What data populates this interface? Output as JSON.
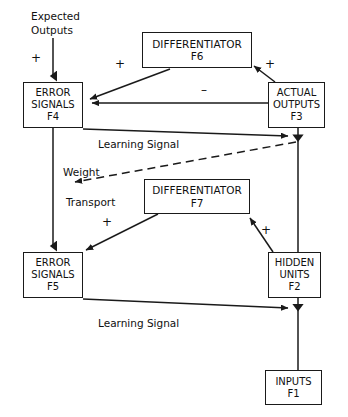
{
  "diagram": {
    "background_color": "#ffffff",
    "line_color": "#1a1a1a",
    "text_color": "#101010",
    "nodes": [
      {
        "id": "F6",
        "name": "differentiator-f6",
        "line1": "DIFFERENTIATOR",
        "line2": "F6",
        "x": 142,
        "y": 32,
        "w": 110,
        "h": 36,
        "font_size": 10.5
      },
      {
        "id": "F3",
        "name": "actual-outputs-f3",
        "line1": "ACTUAL",
        "line2": "OUTPUTS",
        "line3": "F3",
        "x": 268,
        "y": 82,
        "w": 57,
        "h": 46,
        "font_size": 10
      },
      {
        "id": "F4",
        "name": "error-signals-f4",
        "line1": "ERROR",
        "line2": "SIGNALS",
        "line3": "F4",
        "x": 23,
        "y": 82,
        "w": 60,
        "h": 46,
        "font_size": 10
      },
      {
        "id": "F7",
        "name": "differentiator-f7",
        "line1": "DIFFERENTIATOR",
        "line2": "F7",
        "x": 144,
        "y": 179,
        "w": 106,
        "h": 35,
        "font_size": 10.5
      },
      {
        "id": "F5",
        "name": "error-signals-f5",
        "line1": "ERROR",
        "line2": "SIGNALS",
        "line3": "F5",
        "x": 23,
        "y": 252,
        "w": 60,
        "h": 46,
        "font_size": 10
      },
      {
        "id": "F2",
        "name": "hidden-units-f2",
        "line1": "HIDDEN",
        "line2": "UNITS",
        "line3": "F2",
        "x": 268,
        "y": 252,
        "w": 53,
        "h": 46,
        "font_size": 10
      },
      {
        "id": "F1",
        "name": "inputs-f1",
        "line1": "INPUTS",
        "line2": "F1",
        "x": 265,
        "y": 370,
        "w": 57,
        "h": 35,
        "font_size": 10
      }
    ],
    "labels": [
      {
        "id": "expected-outputs",
        "name": "expected-outputs-label",
        "text": "Expected",
        "x": 31,
        "y": 10,
        "font_size": 10.5
      },
      {
        "id": "expected-outputs-2",
        "name": "expected-outputs-label-line2",
        "text": "Outputs",
        "x": 31,
        "y": 24,
        "font_size": 10.5
      },
      {
        "id": "learning-signal-top",
        "name": "learning-signal-label-top",
        "text": "Learning Signal",
        "x": 98,
        "y": 138,
        "font_size": 10.5
      },
      {
        "id": "weight",
        "name": "weight-label",
        "text": "Weight",
        "x": 63,
        "y": 166,
        "font_size": 10.5
      },
      {
        "id": "transport",
        "name": "transport-label",
        "text": "Transport",
        "x": 66,
        "y": 196,
        "font_size": 10.5
      },
      {
        "id": "learning-signal-bottom",
        "name": "learning-signal-label-bottom",
        "text": "Learning Signal",
        "x": 98,
        "y": 317,
        "font_size": 10.5
      }
    ],
    "signs": [
      {
        "id": "plus-expected",
        "name": "plus-sign-expected-outputs",
        "text": "+",
        "x": 31,
        "y": 52,
        "font_size": 12
      },
      {
        "id": "plus-f6-out",
        "name": "plus-sign-f6-output",
        "text": "+",
        "x": 115,
        "y": 58,
        "font_size": 12
      },
      {
        "id": "plus-f3-up",
        "name": "plus-sign-f3-to-f6",
        "text": "+",
        "x": 265,
        "y": 58,
        "font_size": 12
      },
      {
        "id": "minus-f3-f4",
        "name": "minus-sign-f3-to-f4",
        "text": "–",
        "x": 201,
        "y": 84,
        "font_size": 12
      },
      {
        "id": "plus-f7-left",
        "name": "plus-sign-f7-to-f5",
        "text": "+",
        "x": 102,
        "y": 216,
        "font_size": 12
      },
      {
        "id": "plus-f7-right",
        "name": "plus-sign-f2-to-f7",
        "text": "+",
        "x": 261,
        "y": 224,
        "font_size": 12
      }
    ],
    "edges": [
      {
        "id": "expected-to-f4",
        "name": "edge-expected-outputs-to-f4",
        "style": "solid",
        "arrow": "filled-triangle"
      },
      {
        "id": "f6-to-f4",
        "name": "edge-f6-to-f4",
        "style": "solid",
        "arrow": "filled-triangle"
      },
      {
        "id": "f3-to-f6",
        "name": "edge-f3-to-f6",
        "style": "solid",
        "arrow": "filled-triangle"
      },
      {
        "id": "f3-to-f4",
        "name": "edge-f3-to-f4",
        "style": "solid",
        "arrow": "filled-triangle"
      },
      {
        "id": "f4-to-f3-learning",
        "name": "edge-f4-learning-signal-to-f3",
        "style": "solid",
        "arrow": "filled-triangle"
      },
      {
        "id": "f3-down-to-f2",
        "name": "edge-f3-down-to-f2",
        "style": "solid",
        "arrow": "none"
      },
      {
        "id": "weight-transport",
        "name": "edge-weight-transport-dashed",
        "style": "dashed",
        "arrow": "filled-triangle"
      },
      {
        "id": "f4-to-f5",
        "name": "edge-f4-to-f5",
        "style": "solid",
        "arrow": "filled-triangle"
      },
      {
        "id": "f7-to-f5",
        "name": "edge-f7-to-f5",
        "style": "solid",
        "arrow": "filled-triangle"
      },
      {
        "id": "f2-to-f7",
        "name": "edge-f2-to-f7",
        "style": "solid",
        "arrow": "filled-triangle"
      },
      {
        "id": "f5-to-f2-learning",
        "name": "edge-f5-learning-signal-to-f2",
        "style": "solid",
        "arrow": "filled-triangle"
      },
      {
        "id": "f1-to-f2",
        "name": "edge-f1-to-f2",
        "style": "solid",
        "arrow": "none"
      }
    ]
  }
}
